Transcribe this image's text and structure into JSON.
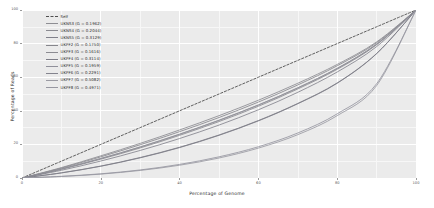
{
  "chart_data": {
    "type": "line",
    "title": "",
    "xlabel": "Percentage of Genome",
    "ylabel": "Percentage of Reads",
    "xlim": [
      0,
      100
    ],
    "ylim": [
      0,
      100
    ],
    "xticks": [
      "0",
      "20",
      "40",
      "60",
      "80",
      "100"
    ],
    "yticks": [
      "0",
      "20",
      "40",
      "60",
      "80",
      "100"
    ],
    "grid": true,
    "legend_position": "top-left",
    "series": [
      {
        "name": "Self",
        "label": "Self",
        "gini": null,
        "style": "dashed",
        "color": "#4f4f4f",
        "x": [
          0,
          10,
          20,
          30,
          40,
          50,
          60,
          70,
          80,
          90,
          100
        ],
        "y": [
          0,
          10,
          20,
          30,
          40,
          50,
          60,
          70,
          80,
          90,
          100
        ]
      },
      {
        "name": "UKNS3",
        "label": "UKNS3 (G = 0.1962)",
        "gini": 0.1962,
        "style": "solid",
        "color": "#8e8e93",
        "x": [
          0,
          10,
          20,
          30,
          40,
          50,
          60,
          70,
          80,
          90,
          100
        ],
        "y": [
          0,
          5.4,
          11.6,
          18.4,
          26.0,
          34.3,
          43.4,
          53.6,
          65.2,
          79.6,
          100
        ]
      },
      {
        "name": "UKNS4",
        "label": "UKNS4 (G = 0.2044)",
        "gini": 0.2044,
        "style": "solid",
        "color": "#8a8a90",
        "x": [
          0,
          10,
          20,
          30,
          40,
          50,
          60,
          70,
          80,
          90,
          100
        ],
        "y": [
          0,
          5.2,
          11.2,
          17.9,
          25.4,
          33.6,
          42.7,
          53.0,
          64.7,
          79.3,
          100
        ]
      },
      {
        "name": "UKNS5",
        "label": "UKNS5 (G = 0.3129)",
        "gini": 0.3129,
        "style": "solid",
        "color": "#80808a",
        "x": [
          0,
          10,
          20,
          30,
          40,
          50,
          60,
          70,
          80,
          90,
          100
        ],
        "y": [
          0,
          3.0,
          7.0,
          12.0,
          18.1,
          25.4,
          34.0,
          44.2,
          56.4,
          74.0,
          100
        ]
      },
      {
        "name": "UKPF2",
        "label": "UKPF2 (G = 0.1750)",
        "gini": 0.175,
        "style": "solid",
        "color": "#86868c",
        "x": [
          0,
          10,
          20,
          30,
          40,
          50,
          60,
          70,
          80,
          90,
          100
        ],
        "y": [
          0,
          5.9,
          12.6,
          19.8,
          27.6,
          36.0,
          45.2,
          55.4,
          66.8,
          80.5,
          100
        ]
      },
      {
        "name": "UKPF3",
        "label": "UKPF3 (G = 0.1616)",
        "gini": 0.1616,
        "style": "solid",
        "color": "#8b8b91",
        "x": [
          0,
          10,
          20,
          30,
          40,
          50,
          60,
          70,
          80,
          90,
          100
        ],
        "y": [
          0,
          6.2,
          13.2,
          20.6,
          28.6,
          37.1,
          46.3,
          56.4,
          67.6,
          81.0,
          100
        ]
      },
      {
        "name": "UKPF4",
        "label": "UKPF4 (G = 0.3114)",
        "gini": 0.3114,
        "style": "solid",
        "color": "#7d7d87",
        "x": [
          0,
          10,
          20,
          30,
          40,
          50,
          60,
          70,
          80,
          90,
          100
        ],
        "y": [
          0,
          3.1,
          7.1,
          12.2,
          18.3,
          25.6,
          34.2,
          44.4,
          56.6,
          74.1,
          100
        ]
      },
      {
        "name": "UKPF5",
        "label": "UKPF5 (G = 0.1959)",
        "gini": 0.1959,
        "style": "solid",
        "color": "#90909a",
        "x": [
          0,
          10,
          20,
          30,
          40,
          50,
          60,
          70,
          80,
          90,
          100
        ],
        "y": [
          0,
          5.4,
          11.6,
          18.5,
          26.1,
          34.4,
          43.5,
          53.7,
          65.3,
          79.7,
          100
        ]
      },
      {
        "name": "UKPF6",
        "label": "UKPF6 (G = 0.2291)",
        "gini": 0.2291,
        "style": "solid",
        "color": "#84848e",
        "x": [
          0,
          10,
          20,
          30,
          40,
          50,
          60,
          70,
          80,
          90,
          100
        ],
        "y": [
          0,
          4.6,
          10.1,
          16.4,
          23.5,
          31.5,
          40.6,
          51.0,
          63.1,
          78.2,
          100
        ]
      },
      {
        "name": "UKPF7",
        "label": "UKPF7 (G = 0.5082)",
        "gini": 0.5082,
        "style": "solid",
        "color": "#9a9aa2",
        "x": [
          0,
          10,
          20,
          30,
          40,
          50,
          60,
          70,
          80,
          90,
          100
        ],
        "y": [
          0,
          0.9,
          2.3,
          4.5,
          7.6,
          11.9,
          17.8,
          25.8,
          37.1,
          55.0,
          100
        ]
      },
      {
        "name": "UKPF8",
        "label": "UKPF8 (G = 0.4971)",
        "gini": 0.4971,
        "style": "solid",
        "color": "#9696a0",
        "x": [
          0,
          10,
          20,
          30,
          40,
          50,
          60,
          70,
          80,
          90,
          100
        ],
        "y": [
          0,
          1.0,
          2.5,
          4.8,
          8.1,
          12.6,
          18.6,
          26.8,
          38.2,
          56.1,
          100
        ]
      }
    ]
  },
  "legend": {
    "items": [
      {
        "label": "Self"
      },
      {
        "label": "UKNS3 (G = 0.1962)"
      },
      {
        "label": "UKNS4 (G = 0.2044)"
      },
      {
        "label": "UKNS5 (G = 0.3129)"
      },
      {
        "label": "UKPF2 (G = 0.1750)"
      },
      {
        "label": "UKPF3 (G = 0.1616)"
      },
      {
        "label": "UKPF4 (G = 0.3114)"
      },
      {
        "label": "UKPF5 (G = 0.1959)"
      },
      {
        "label": "UKPF6 (G = 0.2291)"
      },
      {
        "label": "UKPF7 (G = 0.5082)"
      },
      {
        "label": "UKPF8 (G = 0.4971)"
      }
    ]
  },
  "axes": {
    "x_title": "Percentage of Genome",
    "y_title": "Percentage of Reads",
    "x_ticks": [
      "0",
      "20",
      "40",
      "60",
      "80",
      "100"
    ],
    "y_ticks": [
      "0",
      "20",
      "40",
      "60",
      "80",
      "100"
    ]
  },
  "colors": {
    "panel_bg": "#ebebeb",
    "grid_major": "#ffffff",
    "grid_minor": "#f7f7f7",
    "page_bg": "#ffffff",
    "axis_text": "#5a5a5a"
  }
}
